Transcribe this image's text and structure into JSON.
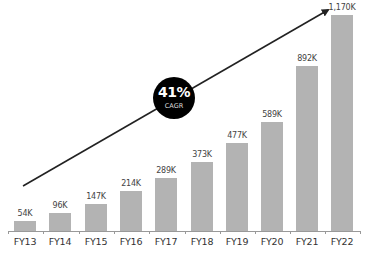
{
  "chart_data": {
    "type": "bar",
    "title": "",
    "xlabel": "",
    "ylabel": "",
    "categories": [
      "FY13",
      "FY14",
      "FY15",
      "FY16",
      "FY17",
      "FY18",
      "FY19",
      "FY20",
      "FY21",
      "FY22"
    ],
    "values": [
      54,
      96,
      147,
      214,
      289,
      373,
      477,
      589,
      892,
      1170
    ],
    "value_labels": [
      "54K",
      "96K",
      "147K",
      "214K",
      "289K",
      "373K",
      "477K",
      "589K",
      "892K",
      "1,170K"
    ],
    "units": "K",
    "ylim": [
      0,
      1200
    ],
    "grid": false,
    "legend": null,
    "bar_color": "#b3b3b3",
    "annotations": [
      {
        "type": "arrow",
        "from": "FY13",
        "to": "FY22",
        "color": "#222222"
      },
      {
        "type": "badge",
        "text": "41%",
        "subtext": "CAGR",
        "background": "#000000"
      }
    ]
  },
  "badge": {
    "value": "41%",
    "label": "CAGR"
  }
}
